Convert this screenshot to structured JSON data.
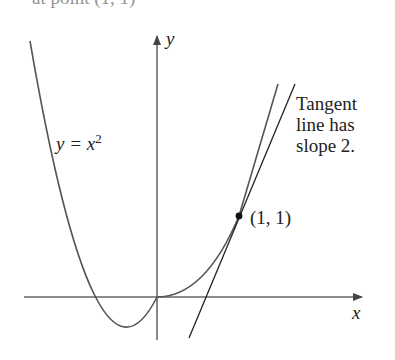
{
  "header": {
    "cut_text": "at point (1, 1)"
  },
  "figure": {
    "axis_x_label": "x",
    "axis_y_label": "y",
    "curve_label_lhs": "y = x",
    "curve_label_exp": "2",
    "point_label": "(1, 1)",
    "tangent_label_lines": [
      "Tangent",
      "line has",
      "slope 2."
    ],
    "colors": {
      "curve": "#555555",
      "axes": "#555555",
      "tangent": "#222222",
      "point": "#111111"
    }
  }
}
